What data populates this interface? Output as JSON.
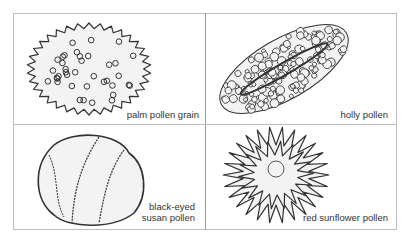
{
  "panels": [
    {
      "id": "palm",
      "label": "palm pollen grain",
      "subject": "palm-pollen-grain-illustration"
    },
    {
      "id": "holly",
      "label": "holly pollen",
      "subject": "holly-pollen-illustration"
    },
    {
      "id": "black-eyed-susan",
      "label_lines": [
        "black-eyed",
        "susan pollen"
      ],
      "subject": "black-eyed-susan-pollen-illustration"
    },
    {
      "id": "red-sunflower",
      "label": "red sunflower pollen",
      "subject": "red-sunflower-pollen-illustration"
    }
  ],
  "colors": {
    "ink": "#333333",
    "fill": "#f3f3f3",
    "border": "#bdbdbd"
  }
}
